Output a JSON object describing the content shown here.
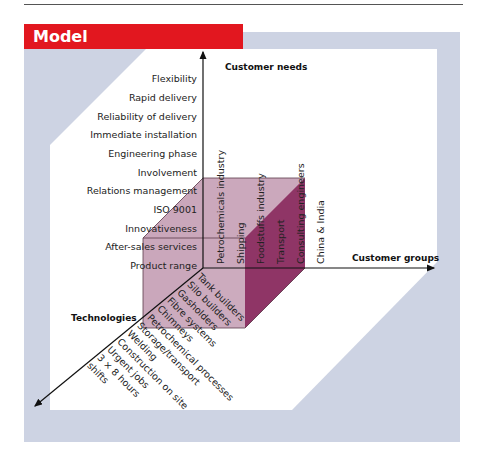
{
  "header": {
    "title": "Model",
    "color": "#e2171f"
  },
  "colors": {
    "outer_panel": "#cdd3e3",
    "inner_panel": "#ffffff",
    "cube_light": "#c9a6bb",
    "cube_dark": "#8f3566",
    "axis": "#111111"
  },
  "axes": {
    "vertical": "Customer needs",
    "horizontal": "Customer groups",
    "diagonal": "Technologies"
  },
  "customer_needs": [
    "Flexibility",
    "Rapid delivery",
    "Reliability of delivery",
    "Immediate installation",
    "Engineering phase",
    "Involvement",
    "Relations management",
    "ISO 9001",
    "Innovativeness",
    "After-sales services",
    "Product range"
  ],
  "customer_groups": [
    "Petrochemicals industry",
    "Shipping",
    "Foodstuffs industry",
    "Transport",
    "Consulting engineers",
    "China & India"
  ],
  "technologies": [
    "Tank builders",
    "Silo builders",
    "Gasholders",
    "Fibre systems",
    "Chimneys",
    "Petrochemical processes",
    "Storage/transport",
    "Welding",
    "Construction on site",
    "Urgent jobs",
    "3 × 8 hours",
    "shifts"
  ]
}
